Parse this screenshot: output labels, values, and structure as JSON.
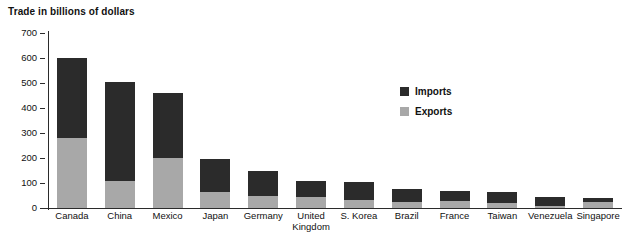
{
  "chart_data": {
    "type": "bar",
    "subtype": "stacked-vertical",
    "title": "Trade in billions of dollars",
    "xlabel": "",
    "ylabel": "",
    "ylim": [
      0,
      700
    ],
    "yticks": [
      0,
      100,
      200,
      300,
      400,
      500,
      600,
      700
    ],
    "ytick_labels": [
      "0",
      "100",
      "200",
      "300",
      "400",
      "500",
      "600",
      "700"
    ],
    "grid": false,
    "legend_position": "inside-upper-right",
    "categories": [
      "Canada",
      "China",
      "Mexico",
      "Japan",
      "Germany",
      "United\nKingdom",
      "S. Korea",
      "Brazil",
      "France",
      "Taiwan",
      "Venezuela",
      "Singapore"
    ],
    "series": [
      {
        "name": "Exports",
        "color": "#a8a8a8",
        "values": [
          280,
          110,
          200,
          65,
          50,
          45,
          32,
          24,
          27,
          22,
          10,
          26
        ]
      },
      {
        "name": "Imports",
        "color": "#2b2b2b",
        "values": [
          320,
          395,
          260,
          133,
          98,
          63,
          71,
          51,
          41,
          43,
          35,
          14
        ]
      }
    ],
    "totals": [
      600,
      505,
      460,
      198,
      148,
      108,
      103,
      75,
      68,
      65,
      45,
      40
    ],
    "colors": {
      "imports": "#2b2b2b",
      "exports": "#a8a8a8",
      "axis": "#2b2b2b",
      "text": "#111111",
      "background": "#ffffff"
    }
  },
  "legend": {
    "items": [
      {
        "label": "Imports",
        "color": "#2b2b2b"
      },
      {
        "label": "Exports",
        "color": "#a8a8a8"
      }
    ]
  }
}
